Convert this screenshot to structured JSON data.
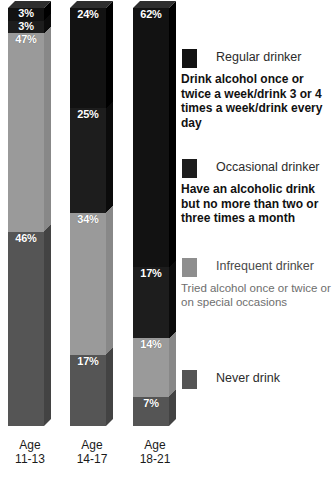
{
  "chart_data": {
    "type": "bar",
    "variant": "100% stacked column (3D)",
    "title": "",
    "subtitle": "",
    "xlabel": "",
    "ylabel": "",
    "ylim": [
      0,
      100
    ],
    "grid": false,
    "legend_position": "right",
    "value_suffix": "%",
    "categories": [
      "Age 11-13",
      "Age 14-17",
      "Age 18-21"
    ],
    "category_lines": [
      [
        "Age",
        "11-13"
      ],
      [
        "Age",
        "14-17"
      ],
      [
        "Age",
        "18-21"
      ]
    ],
    "series": [
      {
        "name": "Regular drinker",
        "color": "#121212",
        "values": [
          3,
          24,
          62
        ]
      },
      {
        "name": "Occasional drinker",
        "color": "#1d1d1d",
        "values": [
          3,
          25,
          17
        ]
      },
      {
        "name": "Infrequent drinker",
        "color": "#9a9a9a",
        "values": [
          47,
          34,
          14
        ]
      },
      {
        "name": "Never drink",
        "color": "#555555",
        "values": [
          46,
          17,
          7
        ]
      }
    ],
    "bars": [
      {
        "category": "Age 11-13",
        "segments": [
          {
            "series": "Regular drinker",
            "value": 3,
            "label": "3%",
            "color": "#121212"
          },
          {
            "series": "Occasional drinker",
            "value": 3,
            "label": "3%",
            "color": "#1d1d1d"
          },
          {
            "series": "Infrequent drinker",
            "value": 47,
            "label": "47%",
            "color": "#9a9a9a"
          },
          {
            "series": "Never drink",
            "value": 46,
            "label": "46%",
            "color": "#555555"
          }
        ]
      },
      {
        "category": "Age 14-17",
        "segments": [
          {
            "series": "Regular drinker",
            "value": 24,
            "label": "24%",
            "color": "#121212"
          },
          {
            "series": "Occasional drinker",
            "value": 25,
            "label": "25%",
            "color": "#1d1d1d"
          },
          {
            "series": "Infrequent drinker",
            "value": 34,
            "label": "34%",
            "color": "#9a9a9a"
          },
          {
            "series": "Never drink",
            "value": 17,
            "label": "17%",
            "color": "#555555"
          }
        ]
      },
      {
        "category": "Age 18-21",
        "segments": [
          {
            "series": "Regular drinker",
            "value": 62,
            "label": "62%",
            "color": "#121212"
          },
          {
            "series": "Occasional drinker",
            "value": 17,
            "label": "17%",
            "color": "#1d1d1d"
          },
          {
            "series": "Infrequent drinker",
            "value": 14,
            "label": "14%",
            "color": "#9a9a9a"
          },
          {
            "series": "Never drink",
            "value": 7,
            "label": "7%",
            "color": "#555555"
          }
        ]
      }
    ]
  },
  "legend": {
    "items": [
      {
        "swatch_color": "#121212",
        "title": "Regular drinker",
        "description": "Drink alcohol once or twice a week/drink 3 or 4 times a week/drink every day"
      },
      {
        "swatch_color": "#1d1d1d",
        "title": "Occasional drinker",
        "description": "Have an alcoholic drink but no more than two or three times a month"
      },
      {
        "swatch_color": "#8e8e8e",
        "title": "Infrequent drinker",
        "description": "Tried alcohol once or twice or on special occasions"
      },
      {
        "swatch_color": "#555555",
        "title": "Never drink",
        "description": ""
      }
    ]
  },
  "footnote": ""
}
